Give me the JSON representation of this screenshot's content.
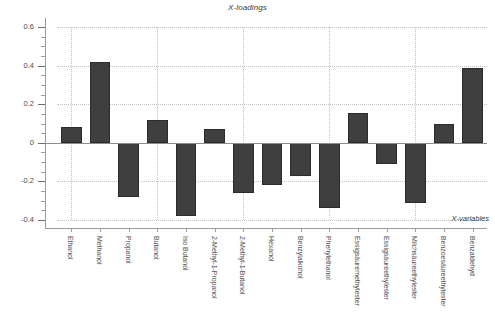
{
  "chart_data": {
    "type": "bar",
    "title": "X-loadings",
    "xlabel": "X-variables",
    "ylabel": "",
    "ylim": [
      -0.45,
      0.62
    ],
    "grid": true,
    "legend": null,
    "ytick_labels": [
      "0.6",
      "0.4",
      "0.2",
      "0",
      "-0.2",
      "-0.4"
    ],
    "ytick_values": [
      0.6,
      0.4,
      0.2,
      0,
      -0.2,
      -0.4
    ],
    "categories": [
      "Ethanol",
      "Methanol",
      "Propanol",
      "Butanol",
      "Iso Butanol",
      "2-Methyl-1-Propanol",
      "2-Methyl-1-Butanol",
      "Hexanol",
      "Benzylalkohol",
      "Phenylethanol",
      "Essigsäuremethylester",
      "Essigsäureethylester",
      "Milchsäureethylester",
      "Benzoesäureethylester",
      "Benzaldehyd"
    ],
    "values": [
      0.08,
      0.42,
      -0.28,
      0.12,
      -0.38,
      0.07,
      -0.26,
      -0.22,
      -0.17,
      -0.34,
      0.155,
      -0.11,
      -0.31,
      0.1,
      0.39
    ],
    "bar_color": "#3f3f3f",
    "grid_color": "#c2c2c2",
    "axis_color": "#9b9b9b",
    "background": "#ffffff"
  }
}
